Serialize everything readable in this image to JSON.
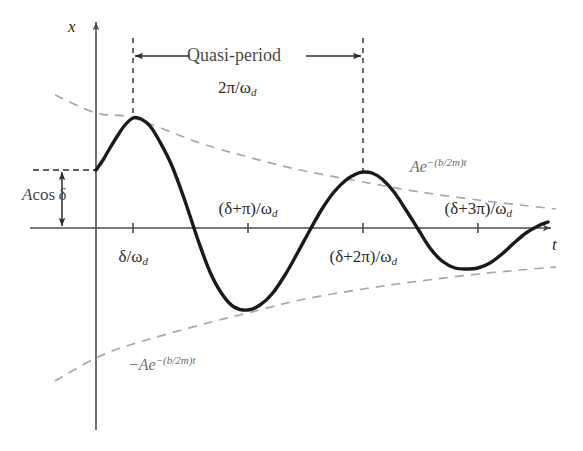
{
  "figure": {
    "kind": "damped-oscillation-diagram",
    "background": "#ffffff",
    "curve_color": "#1a1a1a",
    "envelope_color": "#a8a8a8",
    "axis_color": "#4d4d4d",
    "label_color": "#2b2b2b"
  },
  "axes": {
    "x_axis_label": "x",
    "t_axis_label": "t",
    "origin_px": {
      "x": 96,
      "y": 228
    },
    "t_axis_start_px": 30,
    "t_axis_end_px": 551,
    "x_axis_top_px": 22,
    "x_axis_bottom_px": 430
  },
  "annotations": {
    "quasi_period_label": "Quasi-period",
    "quasi_period_value_pre": "2π/ω",
    "quasi_period_value_sub": "d",
    "amplitude_label_pre": "A",
    "amplitude_label_post": "cos δ",
    "upper_envelope_base": "Ae",
    "upper_envelope_exp": "−(b/2m)t",
    "lower_envelope_base": "−Ae",
    "lower_envelope_exp": "−(b/2m)t"
  },
  "tick_labels": [
    {
      "text_pre": "δ/ω",
      "sub": "d",
      "x_px": 133,
      "y_px": 248,
      "position": "below"
    },
    {
      "text_pre": "(δ+π)/ω",
      "sub": "d",
      "x_px": 248,
      "y_px": 200,
      "position": "above"
    },
    {
      "text_pre": "(δ+2π)/ω",
      "sub": "d",
      "x_px": 363,
      "y_px": 248,
      "position": "below"
    },
    {
      "text_pre": "(δ+3π)/ω",
      "sub": "d",
      "x_px": 478,
      "y_px": 200,
      "position": "above"
    }
  ],
  "chart_data": {
    "type": "line",
    "title": "",
    "xlabel": "t",
    "ylabel": "x",
    "grid": false,
    "legend": "none",
    "x_tick_values": [
      "δ/ω_d",
      "(δ+π)/ω_d",
      "(δ+2π)/ω_d",
      "(δ+3π)/ω_d"
    ],
    "x_tick_px": [
      133,
      248,
      363,
      478
    ],
    "series": [
      {
        "name": "x(t)",
        "style": "solid",
        "color": "#1a1a1a",
        "points_px": [
          [
            96,
            170
          ],
          [
            103,
            160
          ],
          [
            110,
            148
          ],
          [
            118,
            135
          ],
          [
            125,
            125
          ],
          [
            133,
            118
          ],
          [
            141,
            119
          ],
          [
            150,
            126
          ],
          [
            160,
            142
          ],
          [
            172,
            166
          ],
          [
            185,
            201
          ],
          [
            198,
            240
          ],
          [
            210,
            272
          ],
          [
            222,
            294
          ],
          [
            234,
            307
          ],
          [
            248,
            310
          ],
          [
            260,
            305
          ],
          [
            272,
            294
          ],
          [
            285,
            275
          ],
          [
            298,
            252
          ],
          [
            310,
            230
          ],
          [
            322,
            209
          ],
          [
            334,
            192
          ],
          [
            346,
            180
          ],
          [
            356,
            174
          ],
          [
            363,
            172
          ],
          [
            372,
            173
          ],
          [
            382,
            179
          ],
          [
            394,
            192
          ],
          [
            406,
            210
          ],
          [
            418,
            229
          ],
          [
            430,
            248
          ],
          [
            442,
            261
          ],
          [
            455,
            268
          ],
          [
            468,
            269
          ],
          [
            478,
            268
          ],
          [
            490,
            263
          ],
          [
            502,
            254
          ],
          [
            514,
            243
          ],
          [
            526,
            233
          ],
          [
            538,
            226
          ],
          [
            548,
            222
          ]
        ]
      },
      {
        "name": "Ae^{-(b/2m)t}",
        "style": "dashed",
        "color": "#a8a8a8",
        "points_px": [
          [
            55,
            95
          ],
          [
            96,
            113
          ],
          [
            133,
            118
          ],
          [
            200,
            143
          ],
          [
            248,
            157
          ],
          [
            300,
            170
          ],
          [
            363,
            182
          ],
          [
            420,
            192
          ],
          [
            478,
            200
          ],
          [
            520,
            205
          ],
          [
            556,
            209
          ]
        ]
      },
      {
        "name": "-Ae^{-(b/2m)t}",
        "style": "dashed",
        "color": "#a8a8a8",
        "points_px": [
          [
            55,
            381
          ],
          [
            96,
            358
          ],
          [
            133,
            344
          ],
          [
            200,
            325
          ],
          [
            248,
            313
          ],
          [
            300,
            300
          ],
          [
            363,
            289
          ],
          [
            420,
            281
          ],
          [
            478,
            274
          ],
          [
            520,
            270
          ],
          [
            556,
            267
          ]
        ]
      }
    ],
    "guides": [
      {
        "name": "vertical-dash-first-peak",
        "x_px": 133,
        "y1_px": 38,
        "y2_px": 118
      },
      {
        "name": "vertical-dash-second-peak",
        "x_px": 363,
        "y1_px": 38,
        "y2_px": 172
      },
      {
        "name": "horizontal-dash-initial-amplitude",
        "y_px": 170,
        "x1_px": 33,
        "x2_px": 96
      },
      {
        "name": "quasi-period-arrow",
        "y_px": 56,
        "x1_px": 133,
        "x2_px": 363
      },
      {
        "name": "amplitude-arrow",
        "x_px": 62,
        "y1_px": 170,
        "y2_px": 228
      }
    ]
  }
}
